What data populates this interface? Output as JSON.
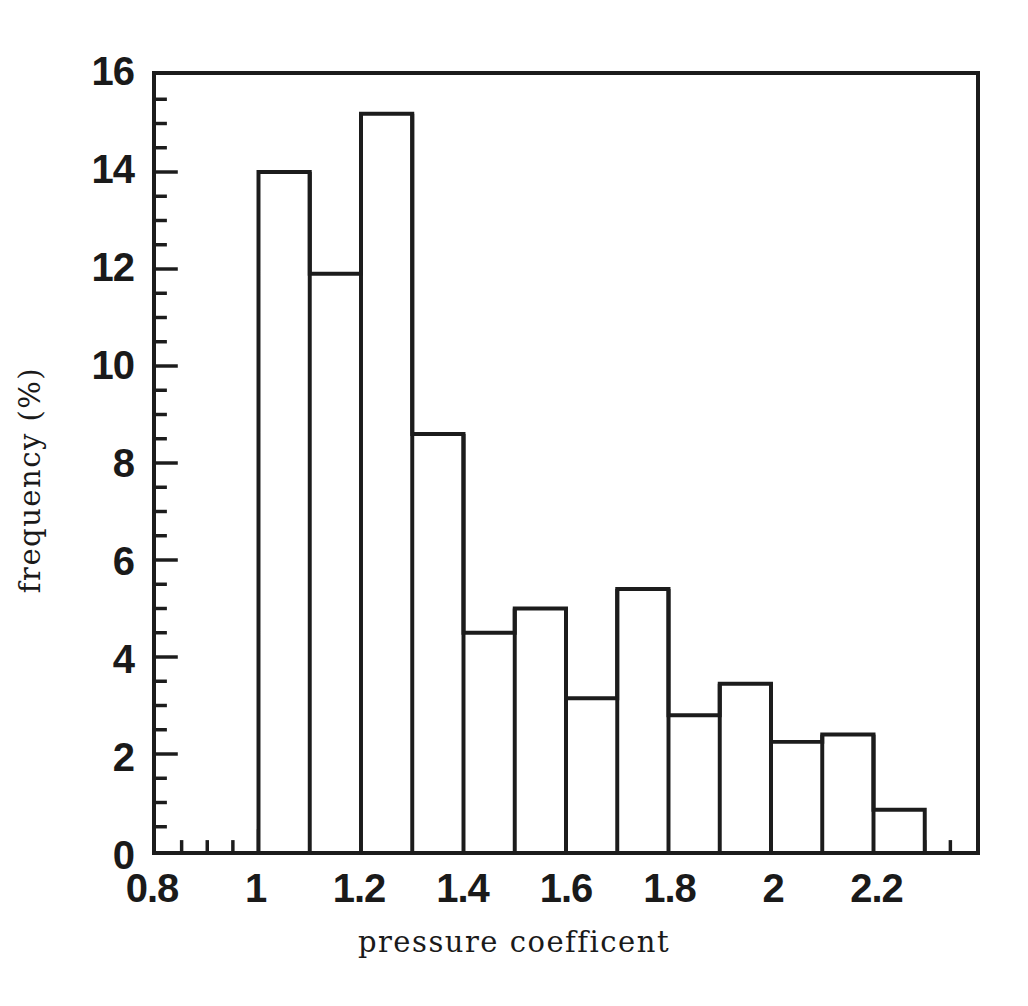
{
  "chart_data": {
    "type": "bar",
    "title": "",
    "xlabel": "pressure coefficent",
    "ylabel": "frequency (%)",
    "xlim": [
      0.8,
      2.4
    ],
    "ylim": [
      0,
      16
    ],
    "grid": false,
    "legend": null,
    "bin_width": 0.1,
    "xticks": [
      0.8,
      1.0,
      1.2,
      1.4,
      1.6,
      1.8,
      2.0,
      2.2
    ],
    "xtick_labels": [
      "0.8",
      "1",
      "1.2",
      "1.4",
      "1.6",
      "1.8",
      "2",
      "2.2"
    ],
    "xtick_minor_step": 0.05,
    "yticks": [
      0,
      2,
      4,
      6,
      8,
      10,
      12,
      14,
      16
    ],
    "ytick_labels": [
      "0",
      "2",
      "4",
      "6",
      "8",
      "10",
      "12",
      "14",
      "16"
    ],
    "ytick_minor_step": 0.5,
    "bin_edges": [
      1.0,
      1.1,
      1.2,
      1.3,
      1.4,
      1.5,
      1.6,
      1.7,
      1.8,
      1.9,
      2.0,
      2.1,
      2.2,
      2.3
    ],
    "categories": [
      "1.0-1.1",
      "1.1-1.2",
      "1.2-1.3",
      "1.3-1.4",
      "1.4-1.5",
      "1.5-1.6",
      "1.6-1.7",
      "1.7-1.8",
      "1.8-1.9",
      "1.9-2.0",
      "2.0-2.1",
      "2.1-2.2",
      "2.2-2.3"
    ],
    "values": [
      14.0,
      11.9,
      15.2,
      8.6,
      4.5,
      5.0,
      3.15,
      5.4,
      2.8,
      3.45,
      2.25,
      2.4,
      0.85
    ],
    "series": [
      {
        "name": "frequency",
        "values": [
          14.0,
          11.9,
          15.2,
          8.6,
          4.5,
          5.0,
          3.15,
          5.4,
          2.8,
          3.45,
          2.25,
          2.4,
          0.85
        ]
      }
    ],
    "style": {
      "line_color": "#1c1c1c",
      "fill_color": "#ffffff",
      "line_width": 4
    }
  }
}
